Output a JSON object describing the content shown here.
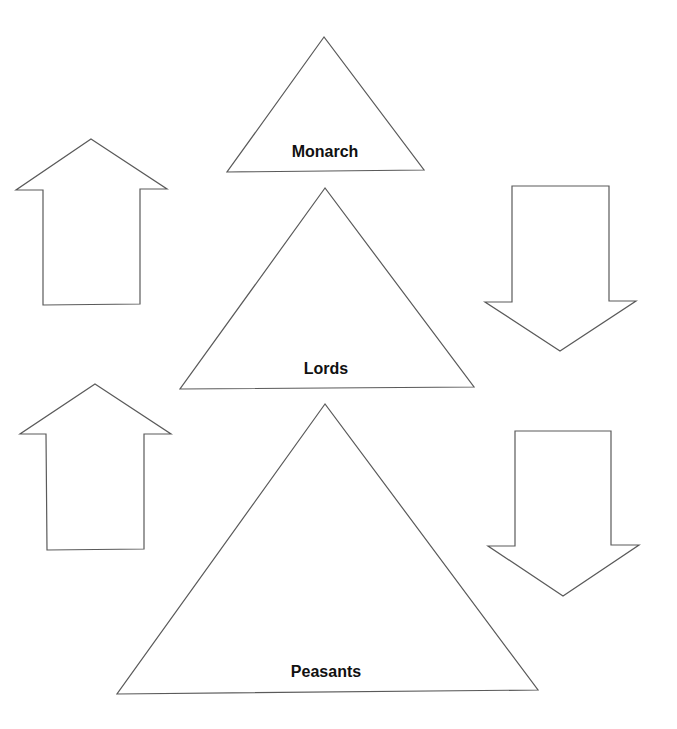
{
  "diagram": {
    "tiers": [
      {
        "label": "Monarch",
        "points": "324,37 227,172 424,170",
        "label_x": 325,
        "label_y": 157
      },
      {
        "label": "Lords",
        "points": "325,188 180,389 474,387",
        "label_x": 326,
        "label_y": 374
      },
      {
        "label": "Peasants",
        "points": "325,404 117,694 538,690",
        "label_x": 326,
        "label_y": 677
      }
    ],
    "arrows": [
      {
        "direction": "up",
        "points": "91,139 167,189 140,189 140,304 43,305 43,190 16,190"
      },
      {
        "direction": "up",
        "points": "95,384 171,434 144,434 144,549 47,550 46,434 20,434"
      },
      {
        "direction": "down",
        "points": "512,186 609,186 609,301 636,301 560,351 485,302 512,302"
      },
      {
        "direction": "down",
        "points": "515,431 611,431 611,545 639,545 563,596 488,546 515,546"
      }
    ]
  }
}
